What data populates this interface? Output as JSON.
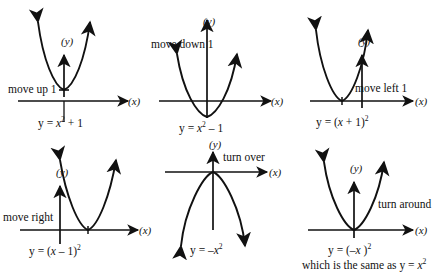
{
  "figure": {
    "background_color": "#ffffff",
    "stroke_color": "#111111",
    "width": 447,
    "height": 276
  },
  "panels": [
    {
      "id": "move-up-1",
      "instruction": "move up 1",
      "equation_prefix": "y = ",
      "equation_var": "x",
      "equation_exp": "2",
      "equation_suffix": " + 1",
      "x_axis_label": "(x)",
      "y_axis_label": "(y)",
      "direction": "up",
      "vertex": {
        "x": 0,
        "y": 1
      }
    },
    {
      "id": "move-down-1",
      "instruction": "move down 1",
      "equation_prefix": "y = ",
      "equation_var": "x",
      "equation_exp": "2",
      "equation_suffix": " – 1",
      "x_axis_label": "(x)",
      "y_axis_label": "(y)",
      "direction": "up",
      "vertex": {
        "x": 0,
        "y": -1
      }
    },
    {
      "id": "move-left-1",
      "instruction": "move left 1",
      "equation_prefix": "y = (",
      "equation_var": "x",
      "equation_mid": " + 1)",
      "equation_exp": "2",
      "x_axis_label": "(x)",
      "y_axis_label": "(y)",
      "direction": "up",
      "vertex": {
        "x": -1,
        "y": 0
      }
    },
    {
      "id": "move-right",
      "instruction": "move right",
      "equation_prefix": "y = (",
      "equation_var": "x",
      "equation_mid": " – 1)",
      "equation_exp": "2",
      "x_axis_label": "(x)",
      "y_axis_label": "(y)",
      "direction": "up",
      "vertex": {
        "x": 1,
        "y": 0
      }
    },
    {
      "id": "turn-over",
      "instruction": "turn over",
      "equation_prefix": "y = –",
      "equation_var": "x",
      "equation_exp": "2",
      "x_axis_label": "(x)",
      "y_axis_label": "(y)",
      "direction": "down",
      "vertex": {
        "x": 0,
        "y": 0
      }
    },
    {
      "id": "turn-around",
      "instruction": "turn around",
      "equation_prefix": "y = (–",
      "equation_var": "x",
      "equation_mid": " )",
      "equation_exp": "2",
      "x_axis_label": "(x)",
      "y_axis_label": "(y)",
      "direction": "up",
      "vertex": {
        "x": 0,
        "y": 0
      },
      "note_prefix": "which is the same as  y = ",
      "note_var": "x",
      "note_exp": "2"
    }
  ]
}
